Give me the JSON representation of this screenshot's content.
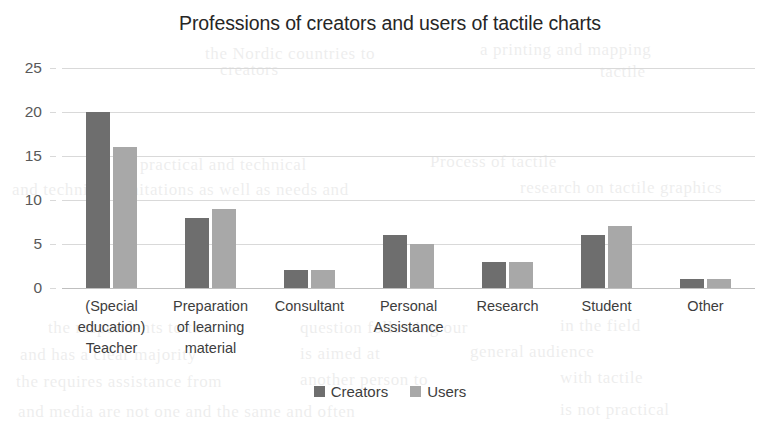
{
  "chart_data": {
    "type": "bar",
    "title": "Professions of creators and users of tactile charts",
    "xlabel": "",
    "ylabel": "",
    "ylim": [
      0,
      25
    ],
    "yticks": [
      0,
      5,
      10,
      15,
      20,
      25
    ],
    "grid": true,
    "legend_position": "bottom",
    "categories": [
      "(Special education) Teacher",
      "Preparation of learning material",
      "Consultant",
      "Personal Assistance",
      "Research",
      "Student",
      "Other"
    ],
    "category_lines": [
      [
        "(Special",
        "education)",
        "Teacher"
      ],
      [
        "Preparation",
        "of learning",
        "material"
      ],
      [
        "Consultant"
      ],
      [
        "Personal",
        "Assistance"
      ],
      [
        "Research"
      ],
      [
        "Student"
      ],
      [
        "Other"
      ]
    ],
    "series": [
      {
        "name": "Creators",
        "color": "#6e6e6e",
        "values": [
          20,
          8,
          2,
          6,
          3,
          6,
          1
        ]
      },
      {
        "name": "Users",
        "color": "#a8a8a8",
        "values": [
          16,
          9,
          2,
          5,
          3,
          7,
          1
        ]
      }
    ]
  },
  "legend": {
    "items": [
      {
        "label": "Creators",
        "color": "#6e6e6e"
      },
      {
        "label": "Users",
        "color": "#a8a8a8"
      }
    ]
  },
  "background_text": [
    {
      "text": "the Nordic countries to",
      "x": 205,
      "y": 44
    },
    {
      "text": "a printing and mapping",
      "x": 480,
      "y": 40
    },
    {
      "text": "practical and technical",
      "x": 140,
      "y": 155
    },
    {
      "text": "Process of tactile",
      "x": 430,
      "y": 152
    },
    {
      "text": "and technical limitations as well as needs and",
      "x": 12,
      "y": 180
    },
    {
      "text": "research on tactile graphics",
      "x": 520,
      "y": 178
    },
    {
      "text": "the respondents to the",
      "x": 48,
      "y": 318
    },
    {
      "text": "question following our",
      "x": 300,
      "y": 318
    },
    {
      "text": "in the field",
      "x": 560,
      "y": 316
    },
    {
      "text": "and has a clear majority",
      "x": 20,
      "y": 345
    },
    {
      "text": "is aimed at",
      "x": 300,
      "y": 344
    },
    {
      "text": "general audience",
      "x": 470,
      "y": 342
    },
    {
      "text": "the requires assistance from",
      "x": 16,
      "y": 372
    },
    {
      "text": "another person to",
      "x": 300,
      "y": 370
    },
    {
      "text": "with tactile",
      "x": 560,
      "y": 368
    },
    {
      "text": "and media are not one and the same and often",
      "x": 18,
      "y": 402
    },
    {
      "text": "is not practical",
      "x": 560,
      "y": 400
    },
    {
      "text": "creators",
      "x": 220,
      "y": 60
    },
    {
      "text": "tactile",
      "x": 600,
      "y": 62
    }
  ]
}
